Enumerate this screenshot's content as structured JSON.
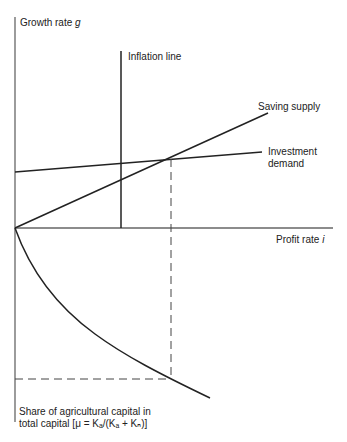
{
  "diagram": {
    "axes": {
      "y_label_text": "Growth rate ",
      "y_label_var": "g",
      "x_label_text": "Profit rate ",
      "x_label_var": "i",
      "lower_label_line1": "Share of agricultural capital in",
      "lower_label_line2": "total capital [μ = Kₐ/(Kₐ + Kₙ)]"
    },
    "lines": {
      "inflation": "Inflation line",
      "saving": "Saving supply",
      "investment_1": "Investment",
      "investment_2": "demand"
    },
    "colors": {
      "line": "#222222",
      "axis": "#555555"
    }
  }
}
